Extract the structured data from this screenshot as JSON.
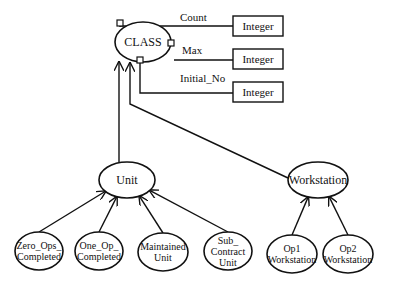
{
  "root": {
    "label": "CLASS",
    "cx": 143,
    "cy": 42,
    "rx": 28,
    "ry": 20
  },
  "attributes": [
    {
      "name": "Count",
      "type": "Integer",
      "label_x": 180,
      "label_y": 21,
      "box_x": 233,
      "box_y": 16,
      "line_y": 26
    },
    {
      "name": "Max",
      "type": "Integer",
      "label_x": 182,
      "label_y": 54,
      "box_x": 233,
      "box_y": 49,
      "line_y": 60
    },
    {
      "name": "Initial_No",
      "type": "Integer",
      "label_x": 180,
      "label_y": 82,
      "box_x": 233,
      "box_y": 82,
      "line_y": 93
    }
  ],
  "subclasses": [
    {
      "label": "Unit",
      "cx": 127,
      "cy": 180,
      "rx": 28,
      "ry": 18
    },
    {
      "label": "Workstation",
      "cx": 318,
      "cy": 180,
      "rx": 30,
      "ry": 18
    }
  ],
  "leaves": [
    {
      "lines": [
        "Zero_Ops_",
        "Completed"
      ],
      "cx": 39,
      "cy": 251,
      "rx": 24,
      "ry": 19,
      "parent": 0
    },
    {
      "lines": [
        "One_Op_",
        "Completed"
      ],
      "cx": 99,
      "cy": 251,
      "rx": 24,
      "ry": 19,
      "parent": 0
    },
    {
      "lines": [
        "Maintained",
        "Unit"
      ],
      "cx": 163,
      "cy": 252,
      "rx": 25,
      "ry": 19,
      "parent": 0
    },
    {
      "lines": [
        "Sub_",
        "Contract",
        "Unit"
      ],
      "cx": 228,
      "cy": 251,
      "rx": 24,
      "ry": 19,
      "parent": 0
    },
    {
      "lines": [
        "Op1",
        "Workstation"
      ],
      "cx": 292,
      "cy": 254,
      "rx": 25,
      "ry": 19,
      "parent": 1
    },
    {
      "lines": [
        "Op2",
        "Workstation"
      ],
      "cx": 348,
      "cy": 254,
      "rx": 25,
      "ry": 19,
      "parent": 1
    }
  ]
}
